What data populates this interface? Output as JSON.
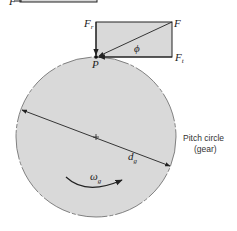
{
  "diagram": {
    "top_partial_label": "F",
    "force_labels": {
      "resultant": "F",
      "radial_main": "F",
      "radial_sub": "r",
      "tangential_main": "F",
      "tangential_sub": "t",
      "angle": "ϕ",
      "point": "P"
    },
    "gear": {
      "diameter_main": "d",
      "diameter_sub": "g",
      "omega_main": "ω",
      "omega_sub": "g",
      "caption_line1": "Pitch circle",
      "caption_line2": "(gear)"
    },
    "colors": {
      "fill": "#d9d9d9",
      "stroke": "#222222",
      "outline": "#555555"
    }
  }
}
